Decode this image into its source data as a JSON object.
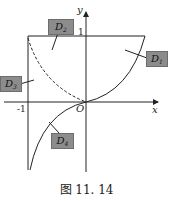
{
  "figure": {
    "caption": "图 11. 14",
    "axes": {
      "x_label": "x",
      "y_label": "y",
      "origin_label": "O",
      "tick_y": "1",
      "tick_x": "-1"
    },
    "regions": [
      {
        "id": "D1",
        "main": "D",
        "sub": "1"
      },
      {
        "id": "D2",
        "main": "D",
        "sub": "2"
      },
      {
        "id": "D3",
        "main": "D",
        "sub": "3"
      },
      {
        "id": "D4",
        "main": "D",
        "sub": "4"
      }
    ],
    "colors": {
      "line": "#222222",
      "tag_fill": "#8c8c8c"
    }
  }
}
